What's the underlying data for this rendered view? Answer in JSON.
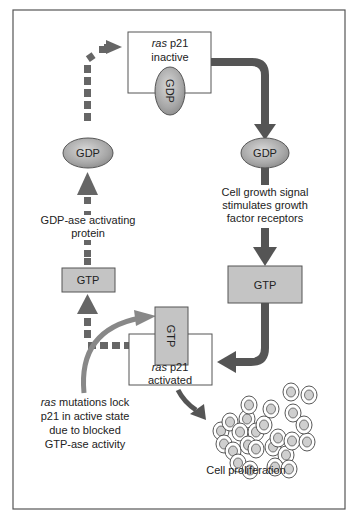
{
  "diagram": {
    "colors": {
      "frame": "#555555",
      "solid_arrow": "#555555",
      "dashed_arrow": "#666666",
      "mutation_arrow": "#808080",
      "gtp_fill": "#c4c4c4",
      "gdp_fill": "#a8a8a8",
      "cell_fill": "#cfcfcf"
    },
    "inactive_box": {
      "line1_italic": "ras",
      "line1_rest": " p21",
      "line2": "inactive",
      "bound": "GDP"
    },
    "right_gdp": {
      "label": "GDP"
    },
    "signal_text": {
      "lines": [
        "Cell growth signal",
        "stimulates growth",
        "factor receptors"
      ]
    },
    "right_gtp": {
      "label": "GTP"
    },
    "activated_box": {
      "line1_italic": "ras",
      "line1_rest": " p21",
      "line2": "activated",
      "bound": "GTP"
    },
    "left_gtp": {
      "label": "GTP"
    },
    "gap_text": {
      "lines": [
        "GDP-ase activating",
        "protein"
      ]
    },
    "left_gdp": {
      "label": "GDP"
    },
    "mutation_text": {
      "line1_italic": "ras",
      "line1_rest": " mutations lock",
      "lines": [
        "p21 in active state",
        "due to blocked",
        "GTP-ase activity"
      ]
    },
    "proliferation": {
      "label": "Cell proliferation"
    }
  }
}
